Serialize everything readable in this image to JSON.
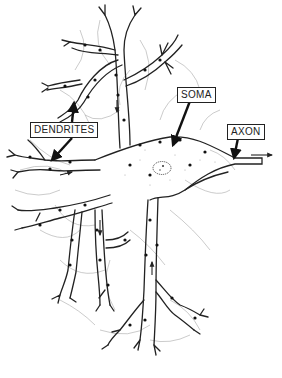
{
  "diagram": {
    "labels": [
      {
        "id": "dendrites",
        "text": "DENDRITES"
      },
      {
        "id": "soma",
        "text": "SOMA"
      },
      {
        "id": "axon",
        "text": "AXON"
      }
    ],
    "colors": {
      "line": "#222222",
      "faint": "#9a9a9a",
      "background": "#ffffff"
    }
  }
}
